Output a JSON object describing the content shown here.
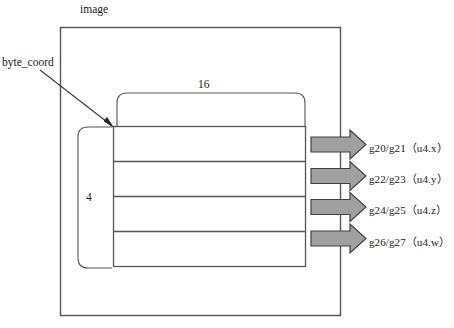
{
  "diagram": {
    "title_label": "image",
    "pointer_label": "byte_coord",
    "width_label": "16",
    "height_label": "4",
    "rows": [
      {
        "label": "g20/g21（u4.x）"
      },
      {
        "label": "g22/g23（u4.y）"
      },
      {
        "label": "g24/g25（u4.z）"
      },
      {
        "label": "g26/g27（u4.w）"
      }
    ],
    "colors": {
      "arrow_fill": "#a0a0a0",
      "arrow_stroke": "#404040",
      "line": "#555555",
      "text": "#191919",
      "background": "#ffffff"
    }
  }
}
